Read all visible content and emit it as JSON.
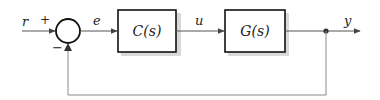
{
  "diagram": {
    "type": "feedback-control-loop",
    "signals": {
      "reference": "r",
      "error": "e",
      "control": "u",
      "output": "y"
    },
    "summing_junction": {
      "plus_sign": "+",
      "minus_sign": "−"
    },
    "blocks": [
      {
        "id": "controller",
        "label": "C(s)"
      },
      {
        "id": "plant",
        "label": "G(s)"
      }
    ],
    "feedback": "unity negative feedback from y to summing junction"
  }
}
